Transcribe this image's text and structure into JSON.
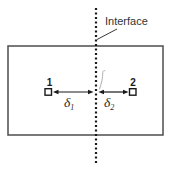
{
  "figure": {
    "interface_label": "Interface",
    "point1_label": "1",
    "point2_label": "2",
    "delta_symbol": "δ",
    "delta1_subscript": "1",
    "delta2_subscript": "2"
  },
  "icons": {
    "center_mark": "faint-curved-slash-mark",
    "interface_line": "vertical-dotted-line",
    "arrows": "double-headed-measurement-arrows"
  },
  "colors": {
    "background": "#ffffff",
    "ink": "#1a1a1a",
    "box_border": "#4d4d4d",
    "text": "#333333",
    "faint_mark": "#b0b0b0"
  }
}
